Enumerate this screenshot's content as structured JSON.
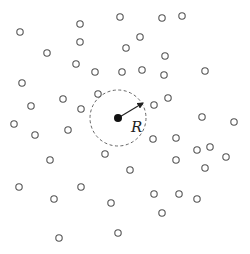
{
  "diagram": {
    "colors": {
      "point_stroke": "#555555",
      "center_fill": "#111111",
      "circle_stroke": "#666666",
      "arrow": "#222222"
    },
    "center": {
      "x": 118,
      "y": 118,
      "r": 4
    },
    "neighborhood": {
      "cx": 118,
      "cy": 118,
      "radius": 28,
      "style": "dashed"
    },
    "radius_arrow": {
      "x1": 118,
      "y1": 118,
      "x2": 143,
      "y2": 103
    },
    "radius_label": {
      "text": "R",
      "x": 131,
      "y": 132
    },
    "point_radius": 3.2,
    "points": [
      [
        20,
        32
      ],
      [
        80,
        24
      ],
      [
        80,
        42
      ],
      [
        47,
        53
      ],
      [
        120,
        17
      ],
      [
        126,
        48
      ],
      [
        140,
        37
      ],
      [
        162,
        18
      ],
      [
        182,
        16
      ],
      [
        165,
        56
      ],
      [
        76,
        64
      ],
      [
        95,
        72
      ],
      [
        122,
        72
      ],
      [
        142,
        70
      ],
      [
        164,
        75
      ],
      [
        205,
        71
      ],
      [
        22,
        83
      ],
      [
        63,
        99
      ],
      [
        31,
        106
      ],
      [
        98,
        94
      ],
      [
        81,
        109
      ],
      [
        154,
        105
      ],
      [
        168,
        98
      ],
      [
        14,
        124
      ],
      [
        35,
        135
      ],
      [
        68,
        130
      ],
      [
        202,
        117
      ],
      [
        234,
        122
      ],
      [
        153,
        139
      ],
      [
        176,
        138
      ],
      [
        105,
        154
      ],
      [
        50,
        160
      ],
      [
        197,
        150
      ],
      [
        210,
        147
      ],
      [
        226,
        157
      ],
      [
        176,
        160
      ],
      [
        130,
        170
      ],
      [
        205,
        168
      ],
      [
        19,
        187
      ],
      [
        54,
        199
      ],
      [
        81,
        187
      ],
      [
        111,
        203
      ],
      [
        154,
        194
      ],
      [
        179,
        194
      ],
      [
        197,
        199
      ],
      [
        162,
        213
      ],
      [
        59,
        238
      ],
      [
        118,
        233
      ]
    ]
  }
}
